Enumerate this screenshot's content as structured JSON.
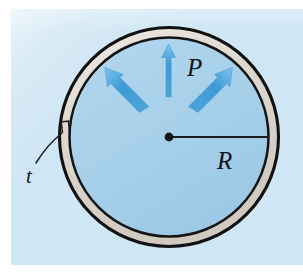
{
  "figure": {
    "type": "engineering-diagram",
    "panel": {
      "background_color": "#cfe6f4",
      "x": 11,
      "y": 9,
      "width": 292,
      "height": 256
    },
    "colors": {
      "page_background": "#ffffff",
      "panel_background": "#cfe6f4",
      "vessel_interior": "#a8d0ea",
      "wall_fill": "#dcd7cf",
      "outline": "#111111",
      "arrow_blue": "#3e9bd4",
      "arrow_blue_light": "#74c0e8",
      "label_color": "#151515",
      "leader_line": "#1b1b1b"
    },
    "geometry": {
      "center": {
        "x": 169,
        "y": 137
      },
      "outer_radius": 110,
      "inner_radius": 100,
      "wall_thickness": 10,
      "radius_line": {
        "from_x": 169,
        "from_y": 137,
        "to_x": 279,
        "to_y": 137
      }
    },
    "labels": [
      {
        "name": "pressure",
        "text": "P",
        "x": 187,
        "y": 55,
        "font_size": 25,
        "style": "italic"
      },
      {
        "name": "radius",
        "text": "R",
        "x": 217,
        "y": 148,
        "font_size": 25,
        "style": "italic"
      },
      {
        "name": "thickness",
        "text": "t",
        "x": 26,
        "y": 166,
        "font_size": 21,
        "style": "italic"
      }
    ],
    "pressure_arrows": [
      {
        "name": "arrow-up-left",
        "angle_deg": 135,
        "tail_r": 88,
        "tip_r": 36,
        "description": "pressure arrow pointing up-left toward wall"
      },
      {
        "name": "arrow-up",
        "angle_deg": 90,
        "tail_r": 92,
        "tip_r": 38,
        "description": "vertical pressure arrow pointing up toward wall"
      },
      {
        "name": "arrow-up-right",
        "angle_deg": 45,
        "tail_r": 88,
        "tip_r": 36,
        "description": "pressure arrow pointing up-right toward wall"
      }
    ],
    "annotations": {
      "thickness_callout": {
        "name": "thickness-leader",
        "description": "curved leader line from the t label to a small bracket spanning the wall thickness on the left side of the vessel",
        "bracket_at": {
          "x": 62,
          "y": 131
        }
      },
      "center_dot": {
        "name": "center-dot",
        "x": 169,
        "y": 137,
        "radius": 4.2
      }
    }
  }
}
